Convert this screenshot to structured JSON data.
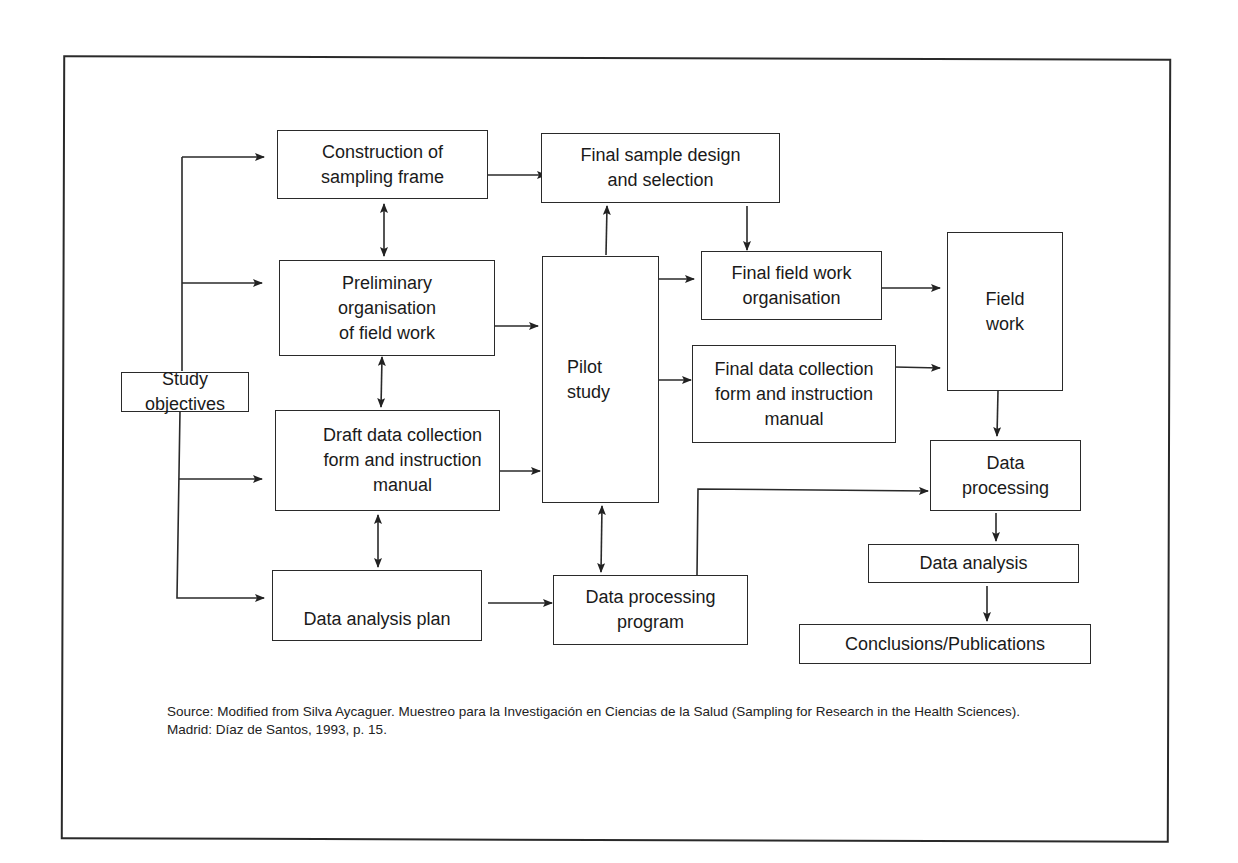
{
  "diagram": {
    "type": "flowchart",
    "nodes": {
      "study_objectives": "Study\nobjectives",
      "construction_sampling_frame": "Construction of\nsampling frame",
      "preliminary_organisation": "Preliminary\norganisation\nof field work",
      "draft_data_collection": "Draft data collection\nform and instruction\nmanual",
      "data_analysis_plan": "Data analysis plan",
      "final_sample_design": "Final sample design\nand selection",
      "pilot_study": "Pilot\nstudy",
      "final_field_work_org": "Final field work\norganisation",
      "final_data_collection": "Final data collection\nform and instruction\nmanual",
      "data_processing_program": "Data processing\nprogram",
      "field_work": "Field\nwork",
      "data_processing": "Data\nprocessing",
      "data_analysis": "Data analysis",
      "conclusions": "Conclusions/Publications"
    },
    "edges": [
      {
        "from": "study_objectives",
        "to": "construction_sampling_frame",
        "type": "arrow"
      },
      {
        "from": "study_objectives",
        "to": "preliminary_organisation",
        "type": "arrow"
      },
      {
        "from": "study_objectives",
        "to": "draft_data_collection",
        "type": "arrow"
      },
      {
        "from": "study_objectives",
        "to": "data_analysis_plan",
        "type": "arrow"
      },
      {
        "from": "construction_sampling_frame",
        "to": "preliminary_organisation",
        "type": "bidirectional"
      },
      {
        "from": "preliminary_organisation",
        "to": "draft_data_collection",
        "type": "bidirectional"
      },
      {
        "from": "draft_data_collection",
        "to": "data_analysis_plan",
        "type": "bidirectional"
      },
      {
        "from": "construction_sampling_frame",
        "to": "final_sample_design",
        "type": "arrow"
      },
      {
        "from": "preliminary_organisation",
        "to": "pilot_study",
        "type": "arrow"
      },
      {
        "from": "draft_data_collection",
        "to": "pilot_study",
        "type": "arrow"
      },
      {
        "from": "data_analysis_plan",
        "to": "data_processing_program",
        "type": "arrow"
      },
      {
        "from": "pilot_study",
        "to": "final_sample_design",
        "type": "arrow"
      },
      {
        "from": "pilot_study",
        "to": "data_processing_program",
        "type": "bidirectional"
      },
      {
        "from": "pilot_study",
        "to": "final_field_work_org",
        "type": "arrow"
      },
      {
        "from": "pilot_study",
        "to": "final_data_collection",
        "type": "arrow"
      },
      {
        "from": "final_sample_design",
        "to": "final_field_work_org",
        "type": "arrow"
      },
      {
        "from": "final_field_work_org",
        "to": "field_work",
        "type": "arrow"
      },
      {
        "from": "final_data_collection",
        "to": "field_work",
        "type": "arrow"
      },
      {
        "from": "field_work",
        "to": "data_processing",
        "type": "arrow"
      },
      {
        "from": "data_processing_program",
        "to": "data_processing",
        "type": "arrow"
      },
      {
        "from": "data_processing",
        "to": "data_analysis",
        "type": "arrow"
      },
      {
        "from": "data_analysis",
        "to": "conclusions",
        "type": "arrow"
      }
    ]
  },
  "source_note": "Source: Modified from Silva Aycaguer. Muestreo para la Investigación en Ciencias de la Salud (Sampling for Research in the Health Sciences). Madrid: Díaz de Santos, 1993,  p. 15."
}
